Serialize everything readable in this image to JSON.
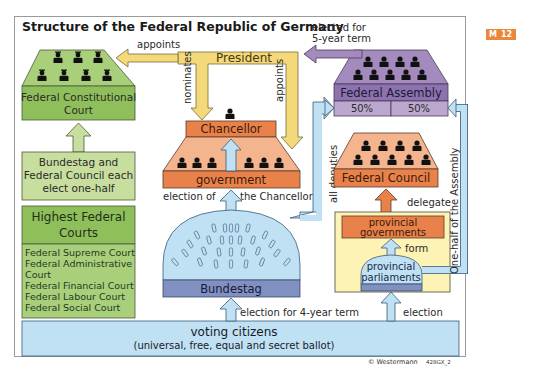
{
  "title": "Structure of the Federal Republic of Germany",
  "badge": {
    "left": "M",
    "right": "12",
    "color": "#e9883a"
  },
  "colors": {
    "court_green": "#8fbf5a",
    "court_light": "#c8de9e",
    "president_yellow": "#f3d97a",
    "assembly_purple": "#9f86b8",
    "assembly_light": "#bca8cf",
    "government_orange": "#e9824a",
    "government_light": "#f4b48e",
    "parliament_blue": "#bfe1f3",
    "bundestag_band": "#8090c0",
    "provincial_yellow": "#fdf3b4"
  },
  "nodes": {
    "constitutional_court": "Federal Constitutional Court",
    "constitutional_court_l1": "Federal Constitutional",
    "constitutional_court_l2": "Court",
    "election_court_l1": "Bundestag and",
    "election_court_l2": "Federal Council each",
    "election_court_l3": "elect one-half",
    "highest_courts_l1": "Highest Federal",
    "highest_courts_l2": "Courts",
    "highest_courts_list": [
      "Federal Supreme Court",
      "Federal Administrative",
      "Court",
      "Federal Financial Court",
      "Federal Labour Court",
      "Federal Social Court"
    ],
    "president": "President",
    "chancellor": "Chancellor",
    "government": "government",
    "federal_assembly": "Federal Assembly",
    "assembly_split": [
      "50%",
      "50%"
    ],
    "federal_council": "Federal Council",
    "bundestag": "Bundestag",
    "provincial_governments_l1": "provincial",
    "provincial_governments_l2": "governments",
    "provincial_parliaments_l1": "provincial",
    "provincial_parliaments_l2": "parliaments",
    "voting_citizens": "voting citizens",
    "voting_citizens_sub": "(universal, free, equal and secret ballot)"
  },
  "arrows": {
    "appoints_court": "appoints",
    "nominates": "nominates",
    "appoints_government": "appoints",
    "elected_l1": "elected for",
    "elected_l2": "5-year term",
    "election_of": "election of",
    "the_chancellor": "the Chancellor",
    "all_deputies": "all deputies",
    "delegate": "delegate",
    "one_half_assembly": "One-half of the Assembly",
    "form": "form",
    "election_4yr": "election for 4-year term",
    "election": "election"
  },
  "copyright": "© Westermann",
  "code": "428GX_2"
}
